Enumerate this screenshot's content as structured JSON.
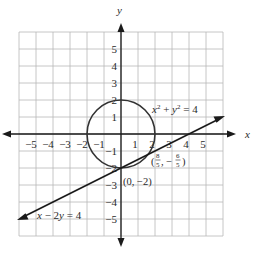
{
  "chart_data": {
    "type": "line",
    "title": "",
    "xlabel": "x",
    "ylabel": "y",
    "xlim": [
      -6,
      6
    ],
    "ylim": [
      -6,
      6
    ],
    "grid": true,
    "x_ticks": [
      -5,
      -4,
      -3,
      -2,
      -1,
      1,
      2,
      3,
      4,
      5
    ],
    "y_ticks": [
      5,
      4,
      3,
      2,
      1,
      -1,
      -2,
      -3,
      -4,
      -5
    ],
    "x_tick_labels": [
      "−5",
      "−4",
      "−3",
      "−2",
      "−1",
      "1",
      "2",
      "3",
      "4",
      "5"
    ],
    "y_tick_labels": [
      "5",
      "4",
      "3",
      "2",
      "1",
      "−1",
      "−2",
      "−3",
      "−4",
      "−5"
    ],
    "series": [
      {
        "name": "x^2 + y^2 = 4",
        "kind": "circle",
        "center": [
          0,
          0
        ],
        "radius": 2
      },
      {
        "name": "x − 2y = 4",
        "kind": "line",
        "points": [
          [
            -6,
            -5
          ],
          [
            6,
            1
          ]
        ]
      }
    ],
    "annotations": [
      {
        "text": "(0, −2)",
        "point": [
          0,
          -2
        ]
      },
      {
        "text": "(8/5, −6/5)",
        "point": [
          1.6,
          -1.2
        ]
      }
    ]
  },
  "labels": {
    "x_axis": "x",
    "y_axis": "y",
    "circle_eq_base_x": "x",
    "circle_eq_base_y": "y",
    "circle_eq_exp": "2",
    "circle_eq_plus": " + ",
    "circle_eq_rhs": " = 4",
    "line_eq_x": "x",
    "line_eq_mid": " − 2",
    "line_eq_y": "y",
    "line_eq_rhs": " = 4",
    "point1": "(0, −2)",
    "point2_open": "(",
    "point2_num1": "8",
    "point2_den1": "5",
    "point2_comma": ", −",
    "point2_num2": "6",
    "point2_den2": "5",
    "point2_close": ")"
  }
}
